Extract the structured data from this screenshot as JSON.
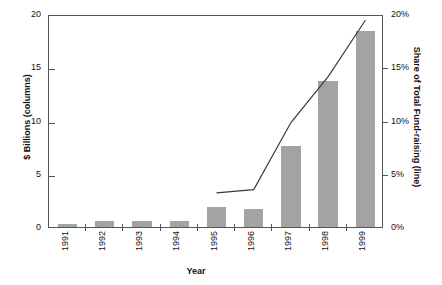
{
  "chart_data": {
    "type": "bar",
    "title": "",
    "subtitle": "",
    "xlabel": "Year",
    "ylabel": "$ Billions (columns)",
    "ylabel_right": "Share of Total Fund-raising (line)",
    "categories": [
      "1991",
      "1992",
      "1993",
      "1994",
      "1995",
      "1996",
      "1997",
      "1998",
      "1999"
    ],
    "ylim": [
      0,
      20
    ],
    "ylim_right": [
      0,
      20
    ],
    "yticks": [
      "0",
      "5",
      "10",
      "15",
      "20"
    ],
    "ytick_values": [
      0,
      5,
      10,
      15,
      20
    ],
    "yticks_right": [
      "0%",
      "5%",
      "10%",
      "15%",
      "20%"
    ],
    "ytick_values_right": [
      0,
      5,
      10,
      15,
      20
    ],
    "grid": false,
    "legend_position": "none",
    "series": [
      {
        "name": "$ Billions (columns)",
        "kind": "bar",
        "color": "#a3a3a3",
        "values": [
          0.25,
          0.6,
          0.6,
          0.6,
          1.9,
          1.7,
          7.6,
          13.7,
          18.4
        ]
      },
      {
        "name": "Share of Total Fund-raising (line)",
        "kind": "line",
        "color": "#3a3a3a",
        "x": [
          "1995",
          "1996",
          "1997",
          "1998",
          "1999"
        ],
        "values": [
          3.4,
          3.7,
          10.0,
          14.3,
          19.6
        ],
        "units": "%"
      }
    ]
  }
}
